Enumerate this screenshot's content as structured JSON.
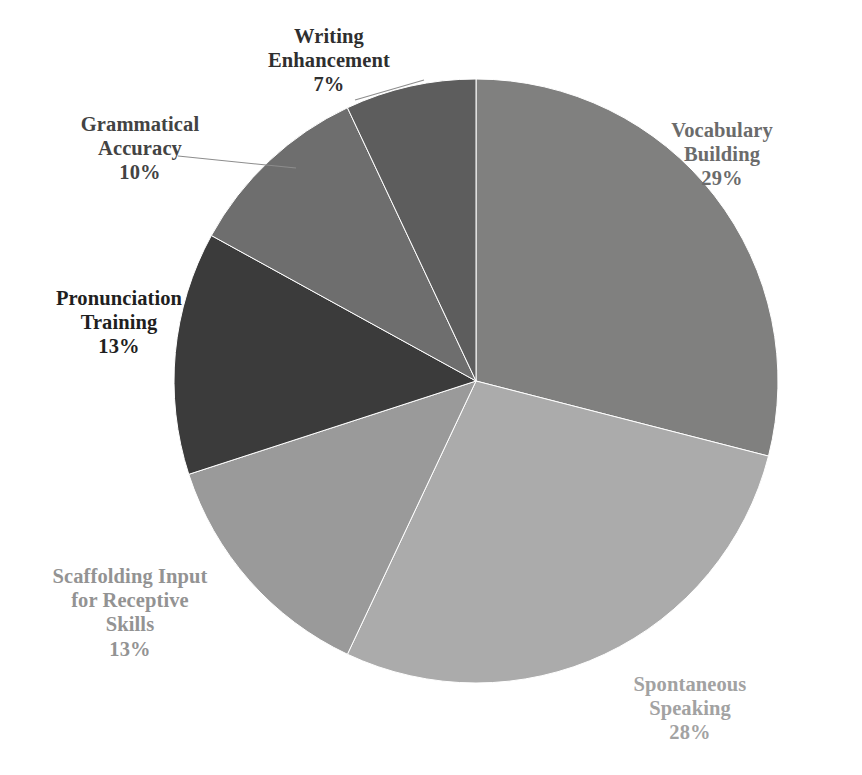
{
  "chart_data": {
    "type": "pie",
    "title": "",
    "subtitle": "",
    "xlabel": "",
    "ylabel": "",
    "legend_position": "none",
    "grid": false,
    "start_angle_deg": 0,
    "direction": "clockwise",
    "categories": [
      "Vocabulary Building",
      "Spontaneous Speaking",
      "Scaffolding Input for Receptive Skills",
      "Pronunciation Training",
      "Grammatical Accuracy",
      "Writing Enhancement"
    ],
    "values": [
      29,
      28,
      13,
      13,
      10,
      7
    ],
    "value_unit": "%",
    "slices": [
      {
        "name": "Vocabulary Building",
        "label_line1": "Vocabulary",
        "label_line2": "Building",
        "percent_text": "29%",
        "value": 29,
        "color": "#80807f",
        "label_color": "#6b6b6b",
        "leader_line": false
      },
      {
        "name": "Spontaneous Speaking",
        "label_line1": "Spontaneous",
        "label_line2": "Speaking",
        "percent_text": "28%",
        "value": 28,
        "color": "#ababab",
        "label_color": "#a2a2a2",
        "leader_line": false
      },
      {
        "name": "Scaffolding Input for Receptive Skills",
        "label_line1": "Scaffolding Input",
        "label_line2": "for Receptive",
        "label_line3": "Skills",
        "percent_text": "13%",
        "value": 13,
        "color": "#9a9a9a",
        "label_color": "#939393",
        "leader_line": false
      },
      {
        "name": "Pronunciation Training",
        "label_line1": "Pronunciation",
        "label_line2": "Training",
        "percent_text": "13%",
        "value": 13,
        "color": "#3b3b3b",
        "label_color": "#1f1f1f",
        "leader_line": false
      },
      {
        "name": "Grammatical Accuracy",
        "label_line1": "Grammatical",
        "label_line2": "Accuracy",
        "percent_text": "10%",
        "value": 10,
        "color": "#6e6e6e",
        "label_color": "#434343",
        "leader_line": true
      },
      {
        "name": "Writing Enhancement",
        "label_line1": "Writing",
        "label_line2": "Enhancement",
        "percent_text": "7%",
        "value": 7,
        "color": "#5d5d5d",
        "label_color": "#2f2f2f",
        "leader_line": true
      }
    ],
    "geometry": {
      "center_x": 476,
      "center_y": 381,
      "radius": 302
    },
    "background_color": "#ffffff"
  }
}
